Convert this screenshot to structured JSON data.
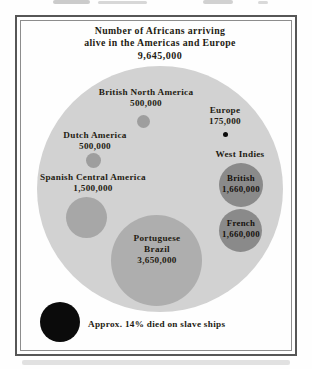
{
  "title": {
    "line1": "Number of Africans arriving",
    "line2": "alive in the Americas and Europe",
    "total": "9,645,000"
  },
  "regions": {
    "british_north_america": {
      "name": "British North America",
      "value": "500,000"
    },
    "europe": {
      "name": "Europe",
      "value": "175,000"
    },
    "dutch_america": {
      "name": "Dutch America",
      "value": "500,000"
    },
    "west_indies_heading": "West Indies",
    "spanish_central_america": {
      "name": "Spanish Central America",
      "value": "1,500,000"
    },
    "portuguese_brazil": {
      "name_line1": "Portuguese",
      "name_line2": "Brazil",
      "value": "3,650,000"
    },
    "west_indies_british": {
      "name": "British",
      "value": "1,660,000"
    },
    "west_indies_french": {
      "name": "French",
      "value": "1,660,000"
    }
  },
  "note": "Approx. 14% died on slave ships",
  "colors": {
    "outer_bubble": "#d2d2d2",
    "small_bubble": "#9e9e9e",
    "medium_bubble": "#a7a7a7",
    "large_bubble": "#aeaeae",
    "west_indies_bubble": "#8a8a8a",
    "black_bubble": "#0b0b0b",
    "ink": "#241c13"
  },
  "chart_data": {
    "type": "bubble",
    "layout": "nested-circles",
    "title": "Number of Africans arriving alive in the Americas and Europe",
    "total": {
      "label": "Total arriving alive",
      "value": 9645000
    },
    "bubbles": [
      {
        "label": "British North America",
        "value": 500000
      },
      {
        "label": "Dutch America",
        "value": 500000
      },
      {
        "label": "Europe",
        "value": 175000
      },
      {
        "label": "Spanish Central America",
        "value": 1500000
      },
      {
        "label": "Portuguese Brazil",
        "value": 3650000
      },
      {
        "label": "West Indies - British",
        "value": 1660000
      },
      {
        "label": "West Indies - French",
        "value": 1660000
      }
    ],
    "annotation": "Approx. 14% died on slave ships"
  }
}
